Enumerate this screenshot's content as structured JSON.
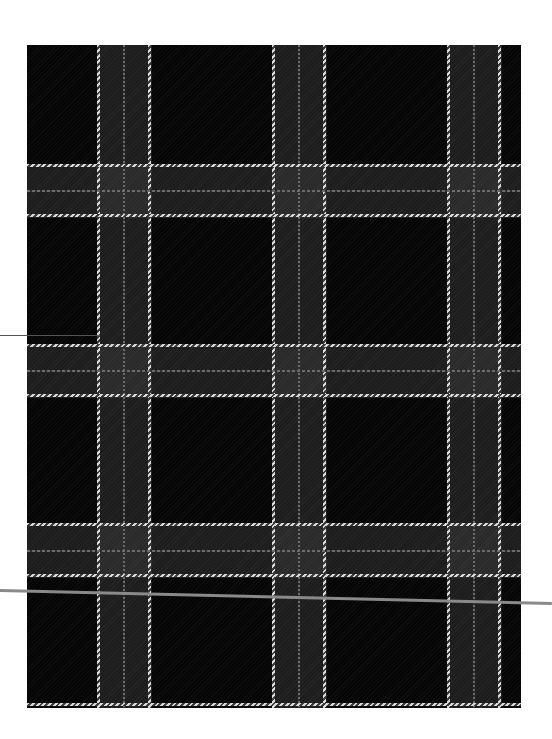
{
  "image": {
    "subject": "tartan plaid fabric swatch",
    "description": "Black-and-grey tartan with white twill overchecks",
    "colors": {
      "background": "#ffffff",
      "fabric_base": "#050505",
      "band_tone": "#1e1e1e",
      "white_stripe": "#d8d8d8",
      "faint_stripe": "#6a6a6a",
      "scan_line": "#8a8a8a"
    },
    "fabric_bounds": {
      "x": 27,
      "y": 45,
      "width": 494,
      "height": 663
    },
    "vertical_stripe_groups": [
      {
        "white_left": 98,
        "faint_center": 123,
        "white_right": 149
      },
      {
        "white_left": 273,
        "faint_center": 298,
        "white_right": 324
      },
      {
        "white_left": 448,
        "faint_center": 473,
        "white_right": 499
      }
    ],
    "horizontal_stripe_groups": [
      {
        "white_top": 165,
        "faint_center": 190,
        "white_bottom": 215
      },
      {
        "white_top": 345,
        "faint_center": 370,
        "white_bottom": 395
      },
      {
        "white_top": 524,
        "faint_center": 550,
        "white_bottom": 575
      }
    ],
    "bottom_edge_stripe": 704,
    "scan_line": {
      "from": [
        0,
        590
      ],
      "to": [
        549,
        603
      ]
    }
  }
}
